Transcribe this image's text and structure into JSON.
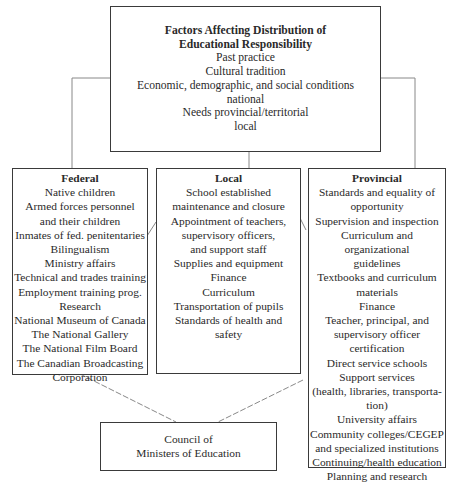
{
  "factors": {
    "title": [
      "Factors Affecting Distribution of",
      "Educational Responsibility"
    ],
    "items": [
      "Past practice",
      "Cultural tradition",
      "Economic, demographic, and social conditions",
      "national",
      "Needs provincial/territorial",
      "local"
    ]
  },
  "federal": {
    "title": "Federal",
    "items": [
      "Native children",
      "Armed forces personnel",
      "and their children",
      "Inmates of fed. penitentaries",
      "Bilingualism",
      "Ministry affairs",
      "Technical and trades training",
      "Employment training prog.",
      "Research",
      "National Museum of Canada",
      "The National Gallery",
      "The National Film Board",
      "The Canadian Broadcasting",
      "Corporation"
    ]
  },
  "local": {
    "title": "Local",
    "items": [
      "School established",
      "maintenance and closure",
      "Appointment of teachers,",
      "supervisory officers,",
      "and support staff",
      "Supplies and equipment",
      "Finance",
      "Curriculum",
      "Transportation of pupils",
      "Standards of health and",
      "safety"
    ]
  },
  "provincial": {
    "title": "Provincial",
    "items": [
      "Standards and equality of",
      "opportunity",
      "Supervision and inspection",
      "Curriculum and",
      "organizational",
      "guidelines",
      "Textbooks and curriculum",
      "materials",
      "Finance",
      "Teacher, principal, and",
      "supervisory officer",
      "certification",
      "Direct service schools",
      "Support services",
      "(health, libraries, transporta-",
      "tion)",
      "University affairs",
      "Community colleges/CEGEP",
      "and specialized institutions",
      "Continuing/health education",
      "Planning and research"
    ]
  },
  "council": {
    "items": [
      "Council of",
      "Ministers of Education"
    ]
  },
  "colors": {
    "line": "#3a3a3a",
    "connector": "#777777"
  }
}
